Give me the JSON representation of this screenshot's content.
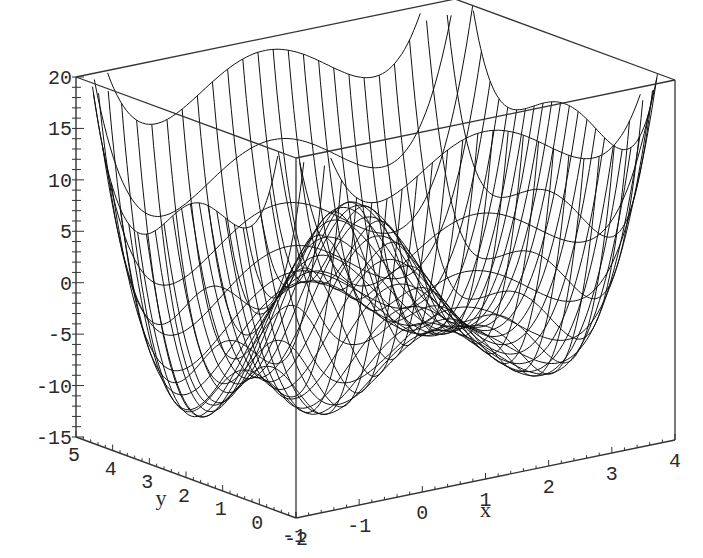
{
  "chart_data": {
    "type": "surface3d-wireframe",
    "title": "",
    "xlabel": "x",
    "ylabel": "y",
    "zlabel": "",
    "x_range": [
      -2,
      4
    ],
    "y_range": [
      -1,
      5
    ],
    "z_range": [
      -15,
      20
    ],
    "x_ticks": [
      "-2",
      "-1",
      "0",
      "1",
      "2",
      "3",
      "4"
    ],
    "y_ticks": [
      "-1",
      "0",
      "1",
      "2",
      "3",
      "4",
      "5"
    ],
    "z_ticks": [
      "20",
      "15",
      "10",
      "5",
      "0",
      "-5",
      "-10",
      "-15"
    ],
    "style": "wireframe",
    "grid": false,
    "box": true,
    "features": [
      {
        "label": "global-minimum",
        "x": -1.5,
        "y": 3.0,
        "z": -15
      },
      {
        "label": "central-hump",
        "x": 0.5,
        "y": 2.0,
        "z": 10
      },
      {
        "label": "secondary-minimum",
        "x": 2.5,
        "y": 1.0,
        "z": 2
      }
    ]
  },
  "axes": {
    "x_name": "x",
    "y_name": "y"
  },
  "colors": {
    "background": "#ffffff",
    "lines": "#111111",
    "text": "#2a2a2a"
  }
}
